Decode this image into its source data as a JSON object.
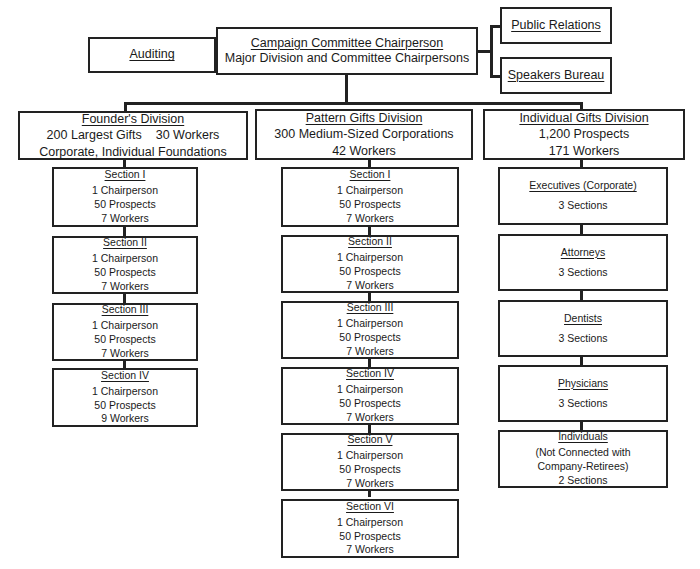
{
  "top": {
    "auditing": "Auditing",
    "chair_title": "Campaign Committee Chairperson",
    "chair_sub": "Major Division and Committee Chairpersons",
    "public_relations": "Public Relations",
    "speakers_bureau": "Speakers Bureau"
  },
  "divisions": [
    {
      "title": "Founder's Division",
      "lines": [
        "200 Largest Gifts    30 Workers",
        "Corporate, Individual Foundations"
      ],
      "sections": [
        {
          "title": "Section I",
          "lines": [
            "1 Chairperson",
            "50 Prospects",
            "7 Workers"
          ]
        },
        {
          "title": "Section II",
          "lines": [
            "1 Chairperson",
            "50 Prospects",
            "7 Workers"
          ]
        },
        {
          "title": "Section III",
          "lines": [
            "1 Chairperson",
            "50 Prospects",
            "7 Workers"
          ]
        },
        {
          "title": "Section IV",
          "lines": [
            "1 Chairperson",
            "50 Prospects",
            "9 Workers"
          ]
        }
      ]
    },
    {
      "title": "Pattern Gifts Division",
      "lines": [
        "300 Medium-Sized Corporations",
        "42 Workers"
      ],
      "sections": [
        {
          "title": "Section I",
          "lines": [
            "1 Chairperson",
            "50 Prospects",
            "7 Workers"
          ]
        },
        {
          "title": "Section II",
          "lines": [
            "1 Chairperson",
            "50 Prospects",
            "7 Workers"
          ]
        },
        {
          "title": "Section III",
          "lines": [
            "1 Chairperson",
            "50 Prospects",
            "7 Workers"
          ]
        },
        {
          "title": "Section IV",
          "lines": [
            "1 Chairperson",
            "50 Prospects",
            "7 Workers"
          ]
        },
        {
          "title": "Section V",
          "lines": [
            "1 Chairperson",
            "50 Prospects",
            "7 Workers"
          ]
        },
        {
          "title": "Section VI",
          "lines": [
            "1 Chairperson",
            "50 Prospects",
            "7 Workers"
          ]
        }
      ]
    },
    {
      "title": "Individual Gifts Division",
      "lines": [
        "1,200 Prospects",
        "171 Workers"
      ],
      "sections": [
        {
          "title": "Executives (Corporate)",
          "lines": [
            "3 Sections"
          ]
        },
        {
          "title": "Attorneys",
          "lines": [
            "3 Sections"
          ]
        },
        {
          "title": "Dentists",
          "lines": [
            "3 Sections"
          ]
        },
        {
          "title": "Physicians",
          "lines": [
            "3 Sections"
          ]
        },
        {
          "title": "Individuals",
          "lines": [
            "(Not Connected with",
            "Company-Retirees)",
            "2 Sections"
          ]
        }
      ]
    }
  ]
}
